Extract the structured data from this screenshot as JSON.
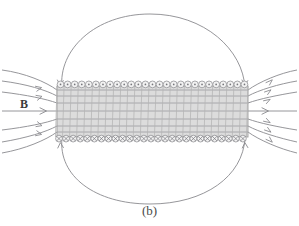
{
  "figure": {
    "caption": "(b)",
    "field_label": "B",
    "colors": {
      "field_line": "#8a8a8f",
      "coil_fill": "#dcdcdc",
      "coil_grid": "#b4b4b4",
      "coil_circle_fill": "#f2f2f2",
      "coil_circle_stroke": "#8d8d92",
      "marker": "#77777c",
      "background": "#ffffff",
      "label_text": "#3a3a3a"
    },
    "solenoid": {
      "left": 57,
      "right": 248,
      "top": 86,
      "bottom": 137,
      "turns": 27,
      "top_marker": "dot-out-of-page",
      "bottom_marker": "cross-into-page"
    }
  },
  "chart_data": {
    "type": "diagram",
    "title": "(b)",
    "subtitle": "",
    "xlabel": "",
    "ylabel": "",
    "annotations": [
      {
        "text": "B",
        "x": 24,
        "y": 104,
        "meaning": "magnetic-field-direction-label"
      },
      {
        "text": "(b)",
        "x": 149,
        "y": 210,
        "meaning": "figure-part-caption"
      }
    ],
    "elements": [
      {
        "name": "solenoid",
        "shape": "rectangle",
        "x0": 57,
        "y0": 86,
        "x1": 248,
        "y1": 137,
        "turns": 27,
        "top_wire_marker": "dot",
        "bottom_wire_marker": "cross"
      },
      {
        "name": "outer-field-loop-top",
        "shape": "arc",
        "direction": "clockwise-right-to-left-over-top"
      },
      {
        "name": "outer-field-loop-bottom",
        "shape": "arc",
        "direction": "clockwise-right-to-left-under-bottom"
      },
      {
        "name": "axial-field-line",
        "shape": "line",
        "x0": 2,
        "y0": 111,
        "x1": 296,
        "y1": 111,
        "direction": "left-to-right"
      }
    ],
    "legend": [],
    "grid": false
  }
}
